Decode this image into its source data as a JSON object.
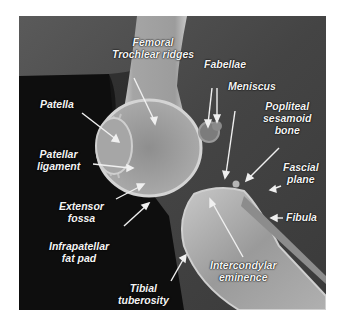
{
  "figure": {
    "colors": {
      "background_page": "#ffffff",
      "film_dark": "#0e0e0e",
      "film_mid": "#4a4a4a",
      "bone": "#bdbdbd",
      "label_text": "#f4f4f4",
      "arrow": "#f0f0f0"
    }
  },
  "labels": {
    "femoral_trochlear_ridges": {
      "line1": "Femoral",
      "line2": "Trochlear ridges"
    },
    "patella": {
      "line1": "Patella"
    },
    "patellar_ligament": {
      "line1": "Patellar",
      "line2": "ligament"
    },
    "extensor_fossa": {
      "line1": "Extensor",
      "line2": "fossa"
    },
    "infrapatellar_fat_pad": {
      "line1": "Infrapatellar",
      "line2": "fat pad"
    },
    "tibial_tuberosity": {
      "line1": "Tibial",
      "line2": "tuberosity"
    },
    "fabellae": {
      "line1": "Fabellae"
    },
    "meniscus": {
      "line1": "Meniscus"
    },
    "popliteal_sesamoid_bone": {
      "line1": "Popliteal",
      "line2": "sesamoid",
      "line3": "bone"
    },
    "fascial_plane": {
      "line1": "Fascial",
      "line2": "plane"
    },
    "fibula": {
      "line1": "Fibula"
    },
    "intercondylar_eminence": {
      "line1": "Intercondylar",
      "line2": "eminence"
    }
  }
}
